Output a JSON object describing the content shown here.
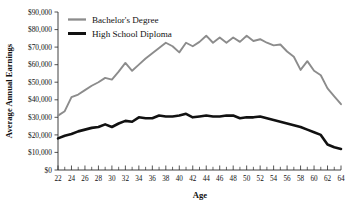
{
  "chart_data": {
    "type": "line",
    "title": "",
    "xlabel": "Age",
    "ylabel": "Average Annual Earnings",
    "xlim": [
      22,
      64
    ],
    "ylim": [
      0,
      90000
    ],
    "grid": false,
    "legend_position": "top-left",
    "x_tick_step": 2,
    "x_minor_tick_step": 1,
    "y_tick_step": 10000,
    "x": [
      22,
      23,
      24,
      25,
      26,
      27,
      28,
      29,
      30,
      31,
      32,
      33,
      34,
      35,
      36,
      37,
      38,
      39,
      40,
      41,
      42,
      43,
      44,
      45,
      46,
      47,
      48,
      49,
      50,
      51,
      52,
      53,
      54,
      55,
      56,
      57,
      58,
      59,
      60,
      61,
      62,
      63,
      64
    ],
    "x_tick_labels": [
      "22",
      "24",
      "26",
      "28",
      "30",
      "32",
      "34",
      "36",
      "38",
      "40",
      "42",
      "44",
      "46",
      "48",
      "50",
      "52",
      "54",
      "56",
      "58",
      "60",
      "62",
      "64"
    ],
    "y_tick_labels": [
      "$0",
      "$10,000",
      "$20,000",
      "$30,000",
      "$40,000",
      "$50,000",
      "$60,000",
      "$70,000",
      "$80,000",
      "$90,000"
    ],
    "y_tick_values": [
      0,
      10000,
      20000,
      30000,
      40000,
      50000,
      60000,
      70000,
      80000,
      90000
    ],
    "series": [
      {
        "name": "Bachelor's Degree",
        "color": "#8c8c8c",
        "line_width": 1.9,
        "values": [
          31000,
          33500,
          41500,
          43000,
          45500,
          48000,
          50000,
          52500,
          51500,
          56000,
          61000,
          56500,
          60000,
          63500,
          66500,
          69500,
          72500,
          70500,
          67000,
          72500,
          70500,
          73000,
          76500,
          72500,
          75500,
          72500,
          75500,
          73000,
          76500,
          73500,
          74500,
          72500,
          71000,
          71500,
          67500,
          64500,
          57000,
          62000,
          56500,
          54000,
          46500,
          42000,
          37500
        ]
      },
      {
        "name": "High School Diploma",
        "color": "#111111",
        "line_width": 2.6,
        "values": [
          18000,
          19500,
          20500,
          22000,
          23000,
          24000,
          24500,
          26000,
          24500,
          26500,
          28000,
          27500,
          30000,
          29500,
          29500,
          31000,
          30500,
          30500,
          31000,
          32000,
          30000,
          30500,
          31000,
          30500,
          30500,
          31000,
          31000,
          29500,
          30000,
          30000,
          30500,
          29500,
          28500,
          27500,
          26500,
          25500,
          24500,
          23000,
          21500,
          20000,
          14500,
          13000,
          12000
        ]
      }
    ]
  }
}
